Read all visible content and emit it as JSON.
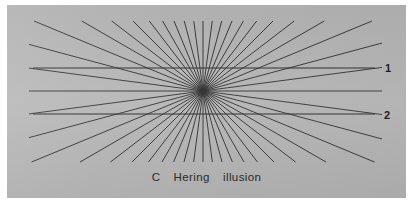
{
  "figure": {
    "caption": "C  Hering  illusion",
    "plate_background_color": "#b6b6b6",
    "page_background_color": "#ffffff",
    "line_color": "#2b2b2b",
    "labels": [
      {
        "name": "line-1-label",
        "text": "1"
      },
      {
        "name": "line-2-label",
        "text": "2"
      }
    ]
  },
  "chart_data": {
    "type": "diagram",
    "title": "C  Hering  illusion",
    "plate": {
      "x": 7,
      "y": 5,
      "width": 399,
      "height": 193
    },
    "vanishing_point": {
      "x": 196,
      "y": 86
    },
    "ray_count": 48,
    "ray_angle_step_degrees": 7.5,
    "ray_inner_radius": 0,
    "ray_outer_radius": 260,
    "ray_stroke_width": 0.9,
    "horizontal_lines": [
      {
        "label": "1",
        "y": 63,
        "x_start": 26,
        "x_end": 368
      },
      {
        "label": "2",
        "y": 109,
        "x_start": 26,
        "x_end": 368
      }
    ],
    "grid": false,
    "legend": "none",
    "xlabel": "",
    "ylabel": ""
  }
}
